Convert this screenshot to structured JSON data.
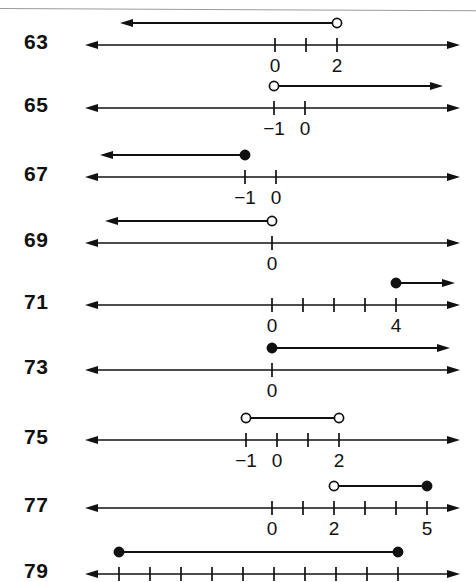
{
  "page": {
    "background_color": "#ffffff",
    "ink_color": "#111111",
    "rule_color": "#9a9a9a",
    "width": 476,
    "height": 582,
    "top_rule": true
  },
  "geometry": {
    "axis_left_x": 85,
    "axis_right_x": 460,
    "unit_px": 31,
    "tick_half_height": 7,
    "graph_offset_y": -22,
    "number_font_size": 21,
    "label_font_size": 19
  },
  "chart_data": {
    "type": "line",
    "xlabel": "",
    "ylabel": "",
    "grid": false,
    "legend": null,
    "rows": [
      {
        "exercise": "63",
        "row_y": 45,
        "number_x": 24,
        "origin_x": 275,
        "ticks": [
          {
            "value": 0,
            "label": "0"
          },
          {
            "value": 1,
            "label": ""
          },
          {
            "value": 2,
            "label": "2"
          }
        ],
        "graph": {
          "kind": "ray",
          "endpoint": 2,
          "endpoint_type": "open",
          "direction": "left",
          "ray_end_x": 120
        }
      },
      {
        "exercise": "65",
        "row_y": 108,
        "number_x": 24,
        "origin_x": 305,
        "ticks": [
          {
            "value": -1,
            "label": "−1"
          },
          {
            "value": 0,
            "label": "0"
          }
        ],
        "graph": {
          "kind": "ray",
          "endpoint": -1,
          "endpoint_type": "open",
          "direction": "right",
          "ray_end_x": 443
        }
      },
      {
        "exercise": "67",
        "row_y": 177,
        "number_x": 24,
        "origin_x": 276,
        "ticks": [
          {
            "value": -1,
            "label": "−1"
          },
          {
            "value": 0,
            "label": "0"
          }
        ],
        "graph": {
          "kind": "ray",
          "endpoint": -1,
          "endpoint_type": "closed",
          "direction": "left",
          "ray_end_x": 100
        }
      },
      {
        "exercise": "69",
        "row_y": 243,
        "number_x": 24,
        "origin_x": 272,
        "ticks": [
          {
            "value": 0,
            "label": "0"
          }
        ],
        "graph": {
          "kind": "ray",
          "endpoint": 0,
          "endpoint_type": "open",
          "direction": "left",
          "ray_end_x": 105
        }
      },
      {
        "exercise": "71",
        "row_y": 305,
        "number_x": 24,
        "origin_x": 272,
        "ticks": [
          {
            "value": 0,
            "label": "0"
          },
          {
            "value": 1,
            "label": ""
          },
          {
            "value": 2,
            "label": ""
          },
          {
            "value": 3,
            "label": ""
          },
          {
            "value": 4,
            "label": "4"
          }
        ],
        "graph": {
          "kind": "ray",
          "endpoint": 4,
          "endpoint_type": "closed",
          "direction": "right",
          "ray_end_x": 455
        }
      },
      {
        "exercise": "73",
        "row_y": 370,
        "number_x": 24,
        "origin_x": 272,
        "ticks": [
          {
            "value": 0,
            "label": "0"
          }
        ],
        "graph": {
          "kind": "ray",
          "endpoint": 0,
          "endpoint_type": "closed",
          "direction": "right",
          "ray_end_x": 450
        }
      },
      {
        "exercise": "75",
        "row_y": 440,
        "number_x": 24,
        "origin_x": 277,
        "ticks": [
          {
            "value": -1,
            "label": "−1"
          },
          {
            "value": 0,
            "label": "0"
          },
          {
            "value": 1,
            "label": ""
          },
          {
            "value": 2,
            "label": "2"
          }
        ],
        "graph": {
          "kind": "segment",
          "left_endpoint": -1,
          "left_type": "open",
          "right_endpoint": 2,
          "right_type": "open"
        }
      },
      {
        "exercise": "77",
        "row_y": 508,
        "number_x": 24,
        "origin_x": 272,
        "ticks": [
          {
            "value": 0,
            "label": "0"
          },
          {
            "value": 1,
            "label": ""
          },
          {
            "value": 2,
            "label": "2"
          },
          {
            "value": 3,
            "label": ""
          },
          {
            "value": 4,
            "label": ""
          },
          {
            "value": 5,
            "label": "5"
          }
        ],
        "graph": {
          "kind": "segment",
          "left_endpoint": 2,
          "left_type": "open",
          "right_endpoint": 5,
          "right_type": "closed"
        }
      },
      {
        "exercise": "79",
        "row_y": 574,
        "number_x": 24,
        "origin_x": 119,
        "ticks": [
          {
            "value": 0,
            "label": ""
          },
          {
            "value": 1,
            "label": ""
          },
          {
            "value": 2,
            "label": ""
          },
          {
            "value": 3,
            "label": ""
          },
          {
            "value": 4,
            "label": ""
          },
          {
            "value": 5,
            "label": ""
          },
          {
            "value": 6,
            "label": ""
          },
          {
            "value": 7,
            "label": ""
          },
          {
            "value": 8,
            "label": ""
          },
          {
            "value": 9,
            "label": ""
          }
        ],
        "graph": {
          "kind": "segment",
          "left_endpoint": 0,
          "left_type": "closed",
          "right_endpoint": 9,
          "right_type": "closed"
        },
        "clipped": true
      }
    ]
  }
}
